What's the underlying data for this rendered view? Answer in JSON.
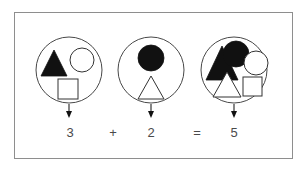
{
  "diagram": {
    "background_color": "#ffffff",
    "frame_color": "#8e8e8e",
    "stroke_color": "#222222",
    "fill_black": "#111111",
    "fill_white": "#ffffff",
    "text_color": "#4a4a4a",
    "groups": [
      {
        "id": "group-a",
        "count_label": "3",
        "cx": 69,
        "cy": 70,
        "r": 33,
        "shapes": [
          {
            "name": "black-triangle",
            "type": "triangle",
            "fill": "black",
            "cx": 54,
            "cy": 63,
            "size": 26
          },
          {
            "name": "white-circle",
            "type": "circle",
            "fill": "white",
            "cx": 81,
            "cy": 60,
            "r": 12
          },
          {
            "name": "white-square",
            "type": "square",
            "fill": "white",
            "cx": 68,
            "cy": 89,
            "size": 20
          }
        ]
      },
      {
        "id": "group-b",
        "count_label": "2",
        "cx": 151,
        "cy": 70,
        "r": 33,
        "shapes": [
          {
            "name": "black-circle",
            "type": "circle",
            "fill": "black",
            "cx": 151,
            "cy": 58,
            "r": 13
          },
          {
            "name": "white-triangle",
            "type": "triangle",
            "fill": "white",
            "cx": 151,
            "cy": 88,
            "size": 26
          }
        ]
      },
      {
        "id": "group-c",
        "count_label": "5",
        "cx": 234,
        "cy": 70,
        "r": 33,
        "shapes": [
          {
            "name": "black-triangle",
            "type": "triangle",
            "fill": "black",
            "cx": 222,
            "cy": 62,
            "size": 26
          },
          {
            "name": "black-circle",
            "type": "circle",
            "fill": "black",
            "cx": 235,
            "cy": 54,
            "r": 13
          },
          {
            "name": "white-circle",
            "type": "circle",
            "fill": "white",
            "cx": 255,
            "cy": 63,
            "r": 12
          },
          {
            "name": "white-triangle",
            "type": "triangle",
            "fill": "white",
            "cx": 227,
            "cy": 86,
            "size": 24
          },
          {
            "name": "white-square",
            "type": "square",
            "fill": "white",
            "cx": 251,
            "cy": 86,
            "size": 19
          }
        ]
      }
    ],
    "arrows": [
      {
        "name": "arrow-group-a",
        "x": 69,
        "y_top": 104,
        "y_bottom": 118
      },
      {
        "name": "arrow-group-b",
        "x": 151,
        "y_top": 104,
        "y_bottom": 118
      },
      {
        "name": "arrow-group-c",
        "x": 234,
        "y_top": 104,
        "y_bottom": 118
      }
    ],
    "equation": {
      "term_1": "3",
      "operator_1": "+",
      "term_2": "2",
      "operator_2": "=",
      "result": "5",
      "full": "3 + 2 = 5"
    }
  }
}
